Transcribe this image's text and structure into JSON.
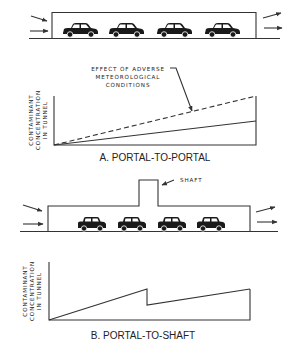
{
  "figure": {
    "panel_a": {
      "caption": "A. PORTAL-TO-PORTAL",
      "annotation": [
        "EFFECT OF ADVERSE",
        "METEOROLOGICAL",
        "CONDITIONS"
      ],
      "y_axis_label": [
        "CONTAMINANT",
        "CONCENTRATION",
        "IN TUNNEL"
      ],
      "vehicle_count": 4
    },
    "panel_b": {
      "caption": "B. PORTAL-TO-SHAFT",
      "shaft_label": "SHAFT",
      "y_axis_label": [
        "CONTAMINANT",
        "CONCENTRATION",
        "IN TUNNEL"
      ],
      "vehicle_count": 4
    },
    "colors": {
      "line": "#333333",
      "vehicle": "#1a1a1a",
      "background": "#ffffff"
    }
  }
}
